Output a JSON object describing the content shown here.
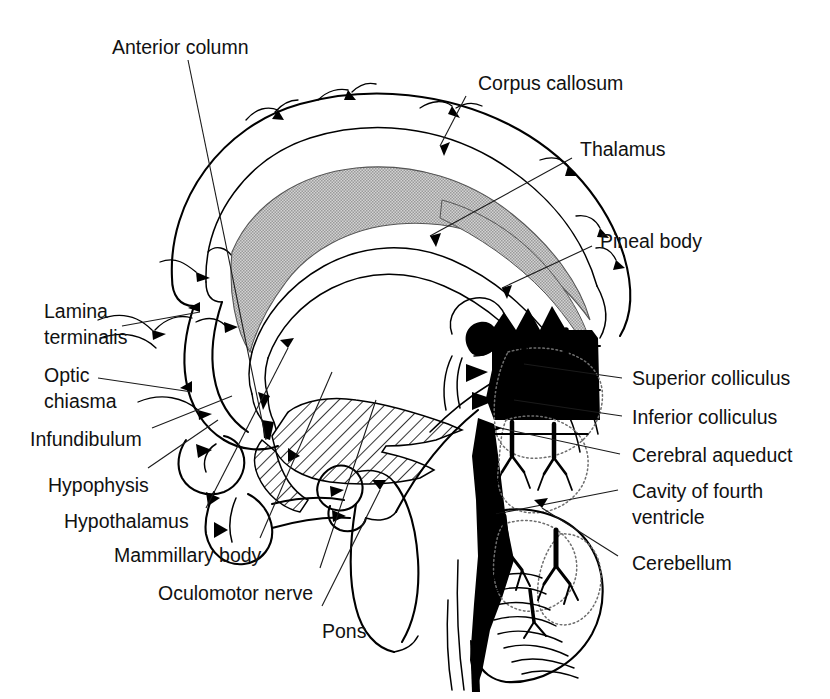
{
  "figure": {
    "background_color": "#ffffff",
    "ink_color": "#000000",
    "corpus_callosum_fill": "#b9b9b9",
    "thalamus_hatch_color": "#000000",
    "leader_color": "#1a1a1a",
    "dotted_outline_color": "#6e6e6e"
  },
  "labels": {
    "anterior_column": "Anterior column",
    "corpus_callosum": "Corpus callosum",
    "thalamus": "Thalamus",
    "pineal_body": "Pineal body",
    "superior_colliculus": "Superior colliculus",
    "inferior_colliculus": "Inferior colliculus",
    "cerebral_aqueduct": "Cerebral aqueduct",
    "cavity_of_fourth_ventricle_line1": "Cavity of fourth",
    "cavity_of_fourth_ventricle_line2": "ventricle",
    "cerebellum": "Cerebellum",
    "lamina_terminalis_line1": "Lamina",
    "lamina_terminalis_line2": "terminalis",
    "optic_chiasma_line1": "Optic",
    "optic_chiasma_line2": "chiasma",
    "infundibulum": "Infundibulum",
    "hypophysis": "Hypophysis",
    "hypothalamus": "Hypothalamus",
    "mammillary_body": "Mammillary body",
    "oculomotor_nerve": "Oculomotor nerve",
    "pons": "Pons"
  },
  "structures": [
    {
      "name": "cerebral-cortex-outline",
      "kind": "outline"
    },
    {
      "name": "corpus-callosum",
      "kind": "filled-gray"
    },
    {
      "name": "fornix",
      "kind": "outline"
    },
    {
      "name": "anterior-column-of-fornix",
      "kind": "outline"
    },
    {
      "name": "thalamus",
      "kind": "hatched"
    },
    {
      "name": "lamina-terminalis",
      "kind": "outline"
    },
    {
      "name": "optic-chiasma",
      "kind": "outline"
    },
    {
      "name": "infundibulum",
      "kind": "outline"
    },
    {
      "name": "hypophysis",
      "kind": "outline"
    },
    {
      "name": "mammillary-body",
      "kind": "outline"
    },
    {
      "name": "oculomotor-nerve",
      "kind": "outline"
    },
    {
      "name": "pons",
      "kind": "outline"
    },
    {
      "name": "midbrain-tectum",
      "kind": "solid-black"
    },
    {
      "name": "pineal-body",
      "kind": "solid-black"
    },
    {
      "name": "superior-colliculus",
      "kind": "solid-black"
    },
    {
      "name": "inferior-colliculus",
      "kind": "solid-black"
    },
    {
      "name": "cerebral-aqueduct",
      "kind": "solid-black"
    },
    {
      "name": "fourth-ventricle-cavity",
      "kind": "solid-black"
    },
    {
      "name": "cerebellum",
      "kind": "arbor-vitae"
    }
  ]
}
